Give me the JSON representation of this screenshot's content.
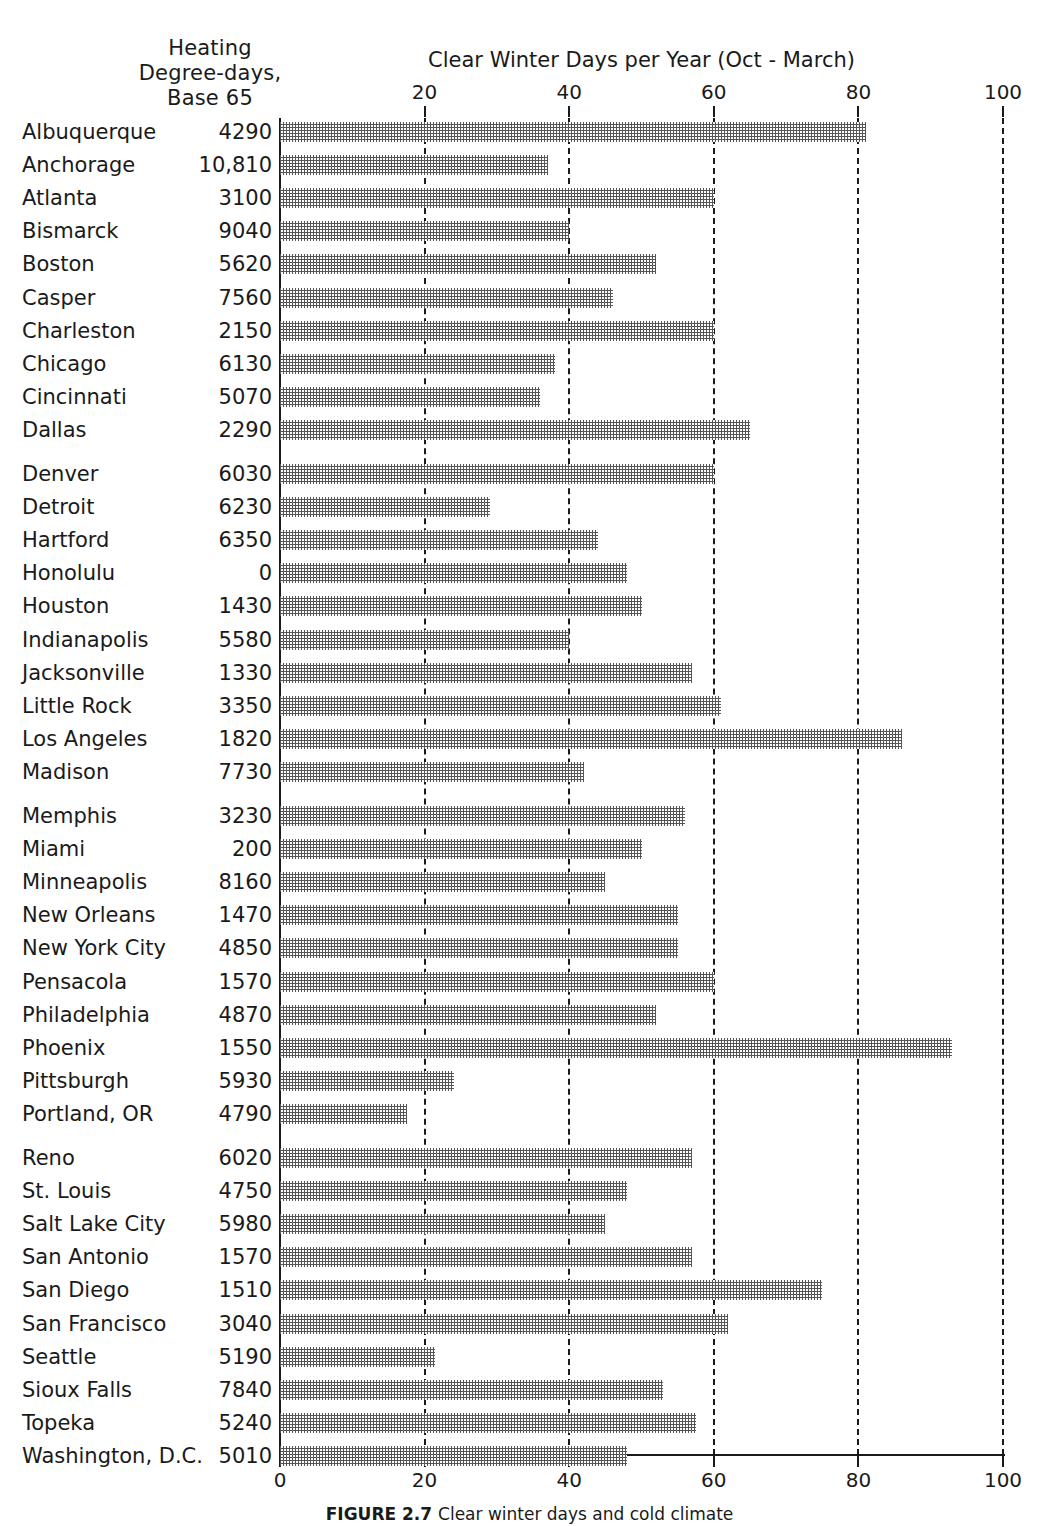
{
  "column_header": {
    "line1": "Heating",
    "line2": "Degree-days,",
    "line3": "Base 65"
  },
  "caption": {
    "figure_number": "FIGURE 2.7",
    "text": "Clear winter days and cold climate"
  },
  "chart_data": {
    "type": "bar",
    "orientation": "horizontal",
    "title": "Clear Winter Days per Year (Oct - March)",
    "xlabel": "",
    "ylabel": "",
    "xlim": [
      0,
      100
    ],
    "xticks": [
      0,
      20,
      40,
      60,
      80,
      100
    ],
    "xtick_labels_top": [
      "20",
      "40",
      "60",
      "80",
      "100"
    ],
    "xtick_labels_bottom": [
      "0",
      "20",
      "40",
      "60",
      "80",
      "100"
    ],
    "grid": "vertical dashed gridlines at 20, 40, 60, 80, 100",
    "legend": "none",
    "series_name": "Clear Winter Days per Year (Oct - March)",
    "secondary_column": "Heating Degree-days, Base 65",
    "group_breaks_after": [
      10,
      20,
      30
    ],
    "categories": [
      "Albuquerque",
      "Anchorage",
      "Atlanta",
      "Bismarck",
      "Boston",
      "Casper",
      "Charleston",
      "Chicago",
      "Cincinnati",
      "Dallas",
      "Denver",
      "Detroit",
      "Hartford",
      "Honolulu",
      "Houston",
      "Indianapolis",
      "Jacksonville",
      "Little Rock",
      "Los Angeles",
      "Madison",
      "Memphis",
      "Miami",
      "Minneapolis",
      "New Orleans",
      "New York City",
      "Pensacola",
      "Philadelphia",
      "Phoenix",
      "Pittsburgh",
      "Portland, OR",
      "Reno",
      "St. Louis",
      "Salt Lake City",
      "San Antonio",
      "San Diego",
      "San Francisco",
      "Seattle",
      "Sioux Falls",
      "Topeka",
      "Washington, D.C."
    ],
    "values": [
      81,
      37,
      60,
      40,
      52,
      46,
      60,
      38,
      36,
      65,
      60,
      29,
      44,
      48,
      50,
      40,
      57,
      61,
      86,
      42,
      56,
      50,
      45,
      55,
      55,
      60,
      52,
      93,
      24,
      17.5,
      57,
      48,
      45,
      57,
      75,
      62,
      21.5,
      53,
      57.5,
      48
    ],
    "heating_degree_days": [
      "4290",
      "10,810",
      "3100",
      "9040",
      "5620",
      "7560",
      "2150",
      "6130",
      "5070",
      "2290",
      "6030",
      "6230",
      "6350",
      "0",
      "1430",
      "5580",
      "1330",
      "3350",
      "1820",
      "7730",
      "3230",
      "200",
      "8160",
      "1470",
      "4850",
      "1570",
      "4870",
      "1550",
      "5930",
      "4790",
      "6020",
      "4750",
      "5980",
      "1570",
      "1510",
      "3040",
      "5190",
      "7840",
      "5240",
      "5010"
    ]
  }
}
